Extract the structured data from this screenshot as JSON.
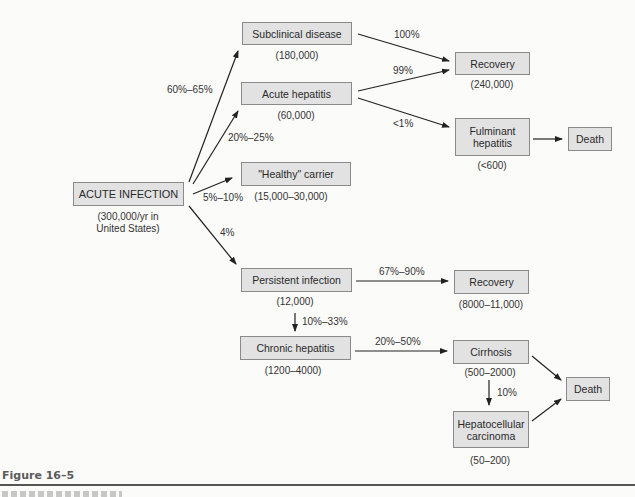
{
  "nodes": {
    "acute_infection": {
      "label": "ACUTE INFECTION",
      "count": "(300,000/yr in",
      "count2": "United States)"
    },
    "subclinical": {
      "label": "Subclinical disease",
      "count": "(180,000)"
    },
    "acute_hepatitis": {
      "label": "Acute hepatitis",
      "count": "(60,000)"
    },
    "healthy_carrier": {
      "label": "\"Healthy\" carrier",
      "count": "(15,000–30,000)"
    },
    "persistent_infection": {
      "label": "Persistent infection",
      "count": "(12,000)"
    },
    "chronic_hepatitis": {
      "label": "Chronic hepatitis",
      "count": "(1200–4000)"
    },
    "recovery_top": {
      "label": "Recovery",
      "count": "(240,000)"
    },
    "fulminant": {
      "label1": "Fulminant",
      "label2": "hepatitis",
      "count": "(<600)"
    },
    "death_top": {
      "label": "Death"
    },
    "recovery_mid": {
      "label": "Recovery",
      "count": "(8000–11,000)"
    },
    "cirrhosis": {
      "label": "Cirrhosis",
      "count": "(500–2000)"
    },
    "hcc": {
      "label1": "Hepatocellular",
      "label2": "carcinoma",
      "count": "(50–200)"
    },
    "death_bottom": {
      "label": "Death"
    }
  },
  "edges": {
    "to_subclinical": "60%–65%",
    "to_acute_hepatitis": "20%–25%",
    "to_healthy_carrier": "5%–10%",
    "to_persistent": "4%",
    "subclinical_to_recovery": "100%",
    "acute_to_recovery": "99%",
    "acute_to_fulminant": "<1%",
    "persistent_to_recovery": "67%–90%",
    "persistent_to_chronic": "10%–33%",
    "chronic_to_cirrhosis": "20%–50%",
    "cirrhosis_to_hcc": "10%"
  },
  "caption": "Figure 16–5"
}
